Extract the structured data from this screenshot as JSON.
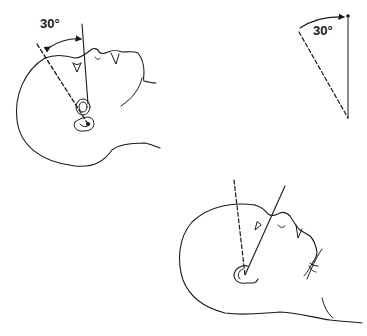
{
  "figure": {
    "panels": [
      {
        "id": "head-tilted",
        "angle_label": "30°",
        "lines": [
          "vertical-reference-solid",
          "ear-axis-dashed"
        ]
      },
      {
        "id": "angle-schematic",
        "angle_label": "30°",
        "lines": [
          "vertical-solid",
          "dashed-30-degree"
        ]
      },
      {
        "id": "head-extended",
        "lines": [
          "dashed-vertical",
          "solid-oblique"
        ]
      }
    ]
  },
  "colors": {
    "ink": "#1a1a1a",
    "background": "#ffffff"
  }
}
